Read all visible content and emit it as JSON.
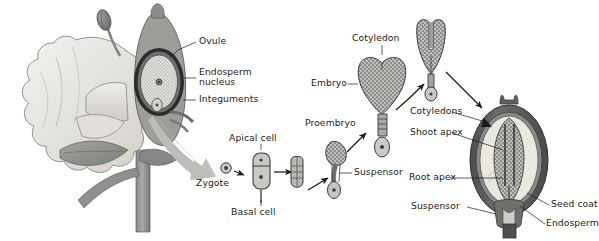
{
  "figure": {
    "type": "biological-process-diagram",
    "background_color": "#ffffff",
    "palette": {
      "ink": "#1b1b1b",
      "outline": "#3a3a3a",
      "petal_light": "#eceae6",
      "petal_mid": "#d8d5cf",
      "stem_gray": "#9a9a96",
      "stem_dark": "#6e6e6b",
      "integument_dark": "#2b2b2b",
      "seed_coat": "#5a5a5a",
      "endosperm_cream": "#ebe8e0",
      "embryo_stipple": "#8d8d8a",
      "big_arrow": "#b9b9b6"
    }
  },
  "labels": {
    "ovule": "Ovule",
    "endosperm_nucleus_l1": "Endosperm",
    "endosperm_nucleus_l2": "nucleus",
    "integuments": "Integuments",
    "zygote": "Zygote",
    "apical_cell": "Apical cell",
    "basal_cell": "Basal cell",
    "proembryo": "Proembryo",
    "suspensor_mid": "Suspensor",
    "embryo": "Embryo",
    "cotyledon": "Cotyledon",
    "cotyledons": "Cotyledons",
    "shoot_apex": "Shoot apex",
    "root_apex": "Root apex",
    "suspensor_seed": "Suspensor",
    "seed_coat": "Seed coat",
    "endosperm": "Endosperm"
  },
  "stages": [
    {
      "name": "flower-with-ovary",
      "label_refs": [
        "ovule",
        "endosperm_nucleus_l1",
        "integuments"
      ]
    },
    {
      "name": "zygote",
      "label_refs": [
        "zygote"
      ]
    },
    {
      "name": "two-cell-stage",
      "label_refs": [
        "apical_cell",
        "basal_cell"
      ]
    },
    {
      "name": "multicell-stage",
      "label_refs": []
    },
    {
      "name": "proembryo-stage",
      "label_refs": [
        "proembryo",
        "suspensor_mid"
      ]
    },
    {
      "name": "heart-stage-embryo",
      "label_refs": [
        "embryo",
        "cotyledon"
      ]
    },
    {
      "name": "torpedo-stage-embryo",
      "label_refs": []
    },
    {
      "name": "mature-seed",
      "label_refs": [
        "cotyledons",
        "shoot_apex",
        "root_apex",
        "suspensor_seed",
        "seed_coat",
        "endosperm"
      ]
    }
  ]
}
